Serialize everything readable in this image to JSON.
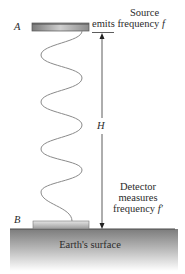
{
  "diagram": {
    "point_a_label": "A",
    "point_b_label": "B",
    "height_label": "H",
    "source_label_line1": "Source",
    "source_label_line2_prefix": "emits",
    "source_label_line2_rest": " frequency ",
    "source_freq_symbol": "f",
    "detector_label_line1": "Detector",
    "detector_label_line2": "measures",
    "detector_label_line3_prefix": "frequency ",
    "detector_freq_symbol": "f′",
    "ground_label": "Earth's surface"
  },
  "colors": {
    "plate_dark": "#6e6e6e",
    "plate_light": "#d8d8d8",
    "ground_top": "#7a7a7a",
    "ground_bottom": "#ffffff",
    "wave": "#8a8a8a",
    "arrow": "#333333"
  }
}
